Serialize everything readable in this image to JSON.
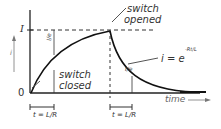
{
  "diagram": {
    "y_axis_label": "i",
    "x_axis_label": "time",
    "origin_label": "0",
    "max_label": "I",
    "annotations": {
      "switch_opened": [
        "switch",
        "opened"
      ],
      "switch_closed": [
        "switch",
        "closed"
      ],
      "decay_equation": "i = e",
      "decay_exponent": "-Rt/L",
      "rise_fraction": "I/e",
      "decay_fraction": "I/e"
    },
    "time_constant_labels": [
      "t = L/R",
      "t = L/R"
    ]
  }
}
